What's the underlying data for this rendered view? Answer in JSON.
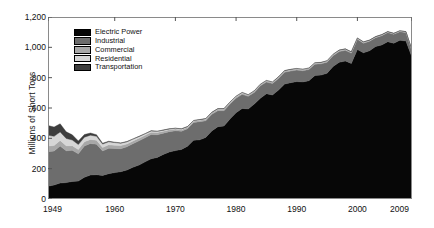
{
  "chart_data": {
    "type": "area",
    "title": "",
    "xlabel": "",
    "ylabel": "Millions of Short Tons",
    "stacked": true,
    "grid": false,
    "legend_position": "top-left",
    "xlim": [
      1949,
      2009
    ],
    "ylim": [
      0,
      1200
    ],
    "ytick_labels": [
      "0",
      "200",
      "400",
      "600",
      "800",
      "1,000",
      "1,200"
    ],
    "ytick_values": [
      0,
      200,
      400,
      600,
      800,
      1000,
      1200
    ],
    "xtick_labels": [
      "1949",
      "1960",
      "1970",
      "1980",
      "1990",
      "2000",
      "2009"
    ],
    "xtick_values": [
      1949,
      1960,
      1970,
      1980,
      1990,
      2000,
      2009
    ],
    "x": [
      1949,
      1950,
      1951,
      1952,
      1953,
      1954,
      1955,
      1956,
      1957,
      1958,
      1959,
      1960,
      1961,
      1962,
      1963,
      1964,
      1965,
      1966,
      1967,
      1968,
      1969,
      1970,
      1971,
      1972,
      1973,
      1974,
      1975,
      1976,
      1977,
      1978,
      1979,
      1980,
      1981,
      1982,
      1983,
      1984,
      1985,
      1986,
      1987,
      1988,
      1989,
      1990,
      1991,
      1992,
      1993,
      1994,
      1995,
      1996,
      1997,
      1998,
      1999,
      2000,
      2001,
      2002,
      2003,
      2004,
      2005,
      2006,
      2007,
      2008,
      2009
    ],
    "series": [
      {
        "name": "Electric Power",
        "color": "#070707",
        "values": [
          84,
          92,
          105,
          108,
          116,
          118,
          143,
          158,
          160,
          155,
          167,
          174,
          180,
          191,
          209,
          224,
          245,
          265,
          274,
          294,
          310,
          319,
          327,
          348,
          387,
          390,
          406,
          449,
          477,
          481,
          527,
          569,
          597,
          594,
          626,
          664,
          694,
          686,
          718,
          758,
          767,
          774,
          772,
          780,
          814,
          817,
          829,
          874,
          901,
          910,
          894,
          986,
          964,
          978,
          1005,
          1016,
          1037,
          1027,
          1046,
          1042,
          934
        ]
      },
      {
        "name": "Industrial",
        "color": "#6d6d6d",
        "values": [
          228,
          224,
          244,
          210,
          205,
          180,
          207,
          208,
          201,
          162,
          167,
          159,
          152,
          153,
          156,
          160,
          159,
          160,
          150,
          140,
          134,
          131,
          120,
          116,
          117,
          120,
          110,
          109,
          105,
          101,
          99,
          96,
          93,
          83,
          77,
          82,
          77,
          75,
          77,
          78,
          77,
          76,
          74,
          74,
          75,
          74,
          73,
          71,
          71,
          70,
          68,
          67,
          63,
          62,
          59,
          61,
          60,
          59,
          57,
          55,
          43
        ]
      },
      {
        "name": "Commercial",
        "color": "#a8a8a8",
        "values": [
          38,
          36,
          37,
          33,
          30,
          28,
          27,
          27,
          26,
          23,
          23,
          21,
          20,
          19,
          18,
          17,
          16,
          15,
          14,
          13,
          12,
          11,
          10,
          9,
          9,
          9,
          9,
          9,
          9,
          9,
          9,
          8,
          8,
          7,
          7,
          7,
          7,
          7,
          7,
          7,
          7,
          7,
          6,
          6,
          6,
          6,
          6,
          6,
          6,
          6,
          5,
          5,
          5,
          5,
          4,
          4,
          4,
          4,
          4,
          4,
          3
        ]
      },
      {
        "name": "Residential",
        "color": "#d6d6d6",
        "values": [
          71,
          61,
          56,
          48,
          38,
          33,
          30,
          28,
          26,
          22,
          20,
          18,
          16,
          14,
          12,
          11,
          10,
          9,
          8,
          7,
          6,
          5,
          5,
          4,
          4,
          4,
          4,
          4,
          4,
          4,
          4,
          4,
          4,
          3,
          3,
          3,
          3,
          3,
          3,
          3,
          3,
          3,
          3,
          3,
          3,
          3,
          3,
          3,
          3,
          3,
          3,
          3,
          3,
          2,
          2,
          2,
          2,
          2,
          2,
          2,
          2
        ]
      },
      {
        "name": "Transportation",
        "color": "#3d3d3d",
        "values": [
          64,
          61,
          54,
          44,
          34,
          24,
          18,
          14,
          11,
          6,
          4,
          3,
          2,
          2,
          1,
          1,
          1,
          1,
          1,
          1,
          1,
          1,
          1,
          1,
          1,
          1,
          1,
          1,
          1,
          1,
          1,
          1,
          1,
          1,
          1,
          1,
          1,
          1,
          1,
          1,
          1,
          1,
          1,
          1,
          1,
          1,
          1,
          1,
          1,
          1,
          1,
          1,
          1,
          1,
          1,
          1,
          1,
          1,
          1,
          1,
          1
        ]
      }
    ]
  },
  "legend": {
    "items": [
      {
        "label": "Electric Power"
      },
      {
        "label": "Industrial"
      },
      {
        "label": "Commercial"
      },
      {
        "label": "Residential"
      },
      {
        "label": "Transportation"
      }
    ]
  }
}
